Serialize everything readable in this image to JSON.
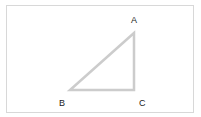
{
  "diagram": {
    "type": "right-triangle",
    "stroke_color": "#cccccc",
    "vertices": [
      {
        "id": "A",
        "label": "A",
        "x": 134,
        "y": 33,
        "label_x": 135,
        "label_y": 23
      },
      {
        "id": "B",
        "label": "B",
        "x": 70,
        "y": 90,
        "label_x": 62,
        "label_y": 106
      },
      {
        "id": "C",
        "label": "C",
        "x": 134,
        "y": 90,
        "label_x": 142,
        "label_y": 106
      }
    ]
  }
}
